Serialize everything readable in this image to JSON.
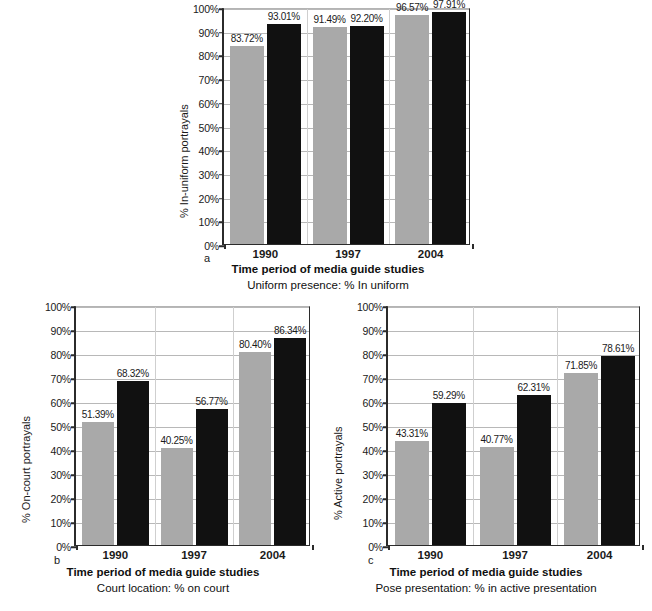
{
  "figure": {
    "panels": [
      "a",
      "b",
      "c"
    ]
  },
  "chart_data": [
    {
      "panel": "a",
      "type": "bar",
      "title": "",
      "xlabel": "Time period of media guide studies",
      "sublabel": "Uniform presence: % In uniform",
      "ylabel": "% In-uniform portrayals",
      "panel_letter": "a",
      "categories": [
        "1990",
        "1997",
        "2004"
      ],
      "ylim": [
        0,
        100
      ],
      "yticks": [
        "0%",
        "10%",
        "20%",
        "30%",
        "40%",
        "50%",
        "60%",
        "70%",
        "80%",
        "90%",
        "100%"
      ],
      "grid": true,
      "legend": "none",
      "series": [
        {
          "name": "grey",
          "color": "#a9a9a9",
          "values": [
            83.72,
            91.49,
            96.57
          ],
          "labels": [
            "83.72%",
            "91.49%",
            "96.57%"
          ]
        },
        {
          "name": "black",
          "color": "#111111",
          "values": [
            93.01,
            92.2,
            97.91
          ],
          "labels": [
            "93.01%",
            "92.20%",
            "97.91%"
          ]
        }
      ]
    },
    {
      "panel": "b",
      "type": "bar",
      "title": "",
      "xlabel": "Time period of media guide studies",
      "sublabel": "Court location: % on court",
      "ylabel": "% On-court portrayals",
      "panel_letter": "b",
      "categories": [
        "1990",
        "1997",
        "2004"
      ],
      "ylim": [
        0,
        100
      ],
      "yticks": [
        "0%",
        "10%",
        "20%",
        "30%",
        "40%",
        "50%",
        "60%",
        "70%",
        "80%",
        "90%",
        "100%"
      ],
      "grid": true,
      "legend": "none",
      "series": [
        {
          "name": "grey",
          "color": "#a9a9a9",
          "values": [
            51.39,
            40.25,
            80.4
          ],
          "labels": [
            "51.39%",
            "40.25%",
            "80.40%"
          ]
        },
        {
          "name": "black",
          "color": "#111111",
          "values": [
            68.32,
            56.77,
            86.34
          ],
          "labels": [
            "68.32%",
            "56.77%",
            "86.34%"
          ]
        }
      ]
    },
    {
      "panel": "c",
      "type": "bar",
      "title": "",
      "xlabel": "Time period of media guide studies",
      "sublabel": "Pose presentation: % in active presentation",
      "ylabel": "% Active portrayals",
      "panel_letter": "c",
      "categories": [
        "1990",
        "1997",
        "2004"
      ],
      "ylim": [
        0,
        100
      ],
      "yticks": [
        "0%",
        "10%",
        "20%",
        "30%",
        "40%",
        "50%",
        "60%",
        "70%",
        "80%",
        "90%",
        "100%"
      ],
      "grid": true,
      "legend": "none",
      "series": [
        {
          "name": "grey",
          "color": "#a9a9a9",
          "values": [
            43.31,
            40.77,
            71.85
          ],
          "labels": [
            "43.31%",
            "40.77%",
            "71.85%"
          ]
        },
        {
          "name": "black",
          "color": "#111111",
          "values": [
            59.29,
            62.31,
            78.61
          ],
          "labels": [
            "59.29%",
            "62.31%",
            "78.61%"
          ]
        }
      ]
    }
  ]
}
